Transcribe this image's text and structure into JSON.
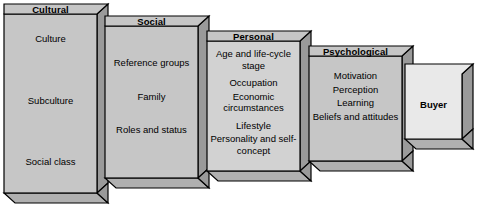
{
  "diagram": {
    "type": "stepped-3d-boxes",
    "colors": {
      "box_face": "#c6c6c6",
      "box_face_light": "#d2d2d2",
      "box_face_buyer": "#e9e9e9",
      "box_side": "#9a9a9a",
      "box_bottom": "#b0b0b0",
      "header_fill": "#c6c6c6",
      "outline": "#000000",
      "page_background": "#ffffff"
    },
    "boxes": [
      {
        "id": "cultural",
        "title": "Cultural",
        "items": [
          "Culture",
          "Subculture",
          "Social class"
        ]
      },
      {
        "id": "social",
        "title": "Social",
        "items": [
          "Reference groups",
          "Family",
          "Roles and status"
        ]
      },
      {
        "id": "personal",
        "title": "Personal",
        "items": [
          "Age and life-cycle stage",
          "Occupation",
          "Economic circumstances",
          "Lifestyle",
          "Personality and self-concept"
        ]
      },
      {
        "id": "psychological",
        "title": "Psychological",
        "items": [
          "Motivation",
          "Perception",
          "Learning",
          "Beliefs and attitudes"
        ]
      },
      {
        "id": "buyer",
        "title": "Buyer",
        "items": []
      }
    ]
  }
}
